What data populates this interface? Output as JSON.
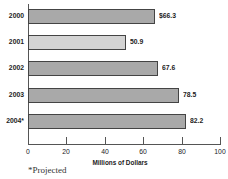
{
  "chart_data": {
    "type": "bar",
    "orientation": "horizontal",
    "title": "",
    "categories": [
      "2000",
      "2001",
      "2002",
      "2003",
      "2004*"
    ],
    "values": [
      66.3,
      50.9,
      67.6,
      78.5,
      82.2
    ],
    "value_labels": [
      "$66.3",
      "50.9",
      "67.6",
      "78.5",
      "82.2"
    ],
    "xlabel": "Millions of Dollars",
    "ylabel": "",
    "xlim": [
      0,
      100
    ],
    "xticks": [
      "0",
      "20",
      "40",
      "60",
      "80",
      "100"
    ],
    "grid": false,
    "legend": null,
    "footnote": "*Projected",
    "bar_colors": [
      "#a9a9a9",
      "#d3d3d3",
      "#a9a9a9",
      "#a9a9a9",
      "#a9a9a9"
    ]
  }
}
